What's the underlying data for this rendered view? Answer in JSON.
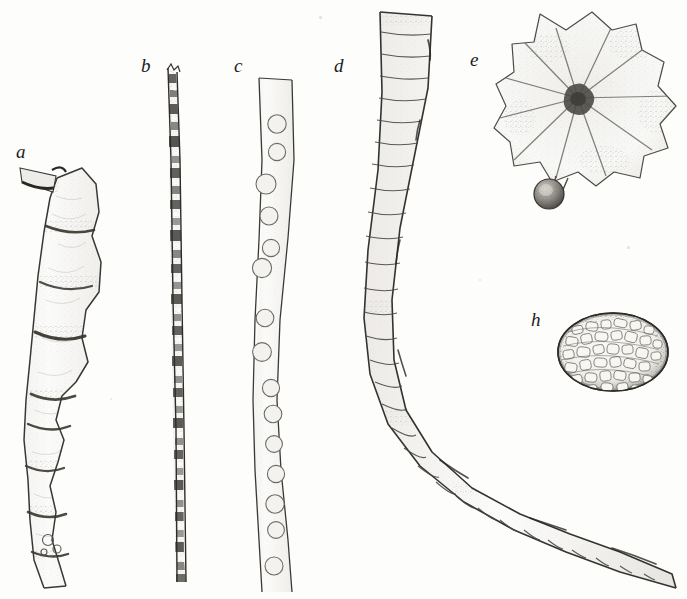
{
  "plate": {
    "kind": "scientific-illustration-plate",
    "medium": "lithograph line drawing, monochrome",
    "background_color": "#fdfdfc",
    "ink_color": "#2b2b2b",
    "width": 687,
    "height": 599,
    "figure_count": 6
  },
  "labels": {
    "a": "a",
    "b": "b",
    "c": "c",
    "d": "d",
    "e": "e",
    "h": "h"
  },
  "figures": [
    {
      "id": "a",
      "label": "a",
      "label_x": 16,
      "label_y": 142,
      "description": "Irregular beaded filament of large swollen cells with constricted cross-walls, running from upper left downward",
      "orientation": "vertical, slightly sinuous",
      "segment_count": 9,
      "shading": "light stipple interior with dark granular cross-walls"
    },
    {
      "id": "b",
      "label": "b",
      "label_x": 141,
      "label_y": 56,
      "description": "Very narrow dark filament with densely packed irregular cell contents",
      "orientation": "vertical, nearly straight",
      "width_px": 9,
      "shading": "heavy dark granulation alternating with pale cell lumina"
    },
    {
      "id": "c",
      "label": "c",
      "label_x": 234,
      "label_y": 56,
      "description": "Pale smooth-walled filament containing a single file of circular spores or vacuoles",
      "orientation": "vertical, gently sinuous",
      "width_px": 34,
      "inclusion_count": 15,
      "inclusion_shape": "circle, faintly stippled"
    },
    {
      "id": "d",
      "label": "d",
      "label_x": 334,
      "label_y": 56,
      "description": "Stout transversely segmented filament arching from top down and sweeping right to a tapering tip",
      "orientation": "curved arc, concave upper right",
      "segment_count": 30,
      "shading": "pale interior, fine transverse septa, darker outline"
    },
    {
      "id": "e",
      "label": "e",
      "label_x": 470,
      "label_y": 50,
      "description": "Flattened lobed thallus with crenate margin and radiating veins from a dark central node, bearing a small dark globular sporangium on a short stalk below",
      "lobe_count": 11,
      "has_stalked_sphere": true,
      "sphere_diameter_px": 30
    },
    {
      "id": "h",
      "label": "h",
      "label_x": 531,
      "label_y": 310,
      "description": "Oval body densely filled with angular packed granules, bordered by a dark stippled rim",
      "shape": "ellipse",
      "width_px": 110,
      "height_px": 78,
      "granule_count": 120
    }
  ]
}
